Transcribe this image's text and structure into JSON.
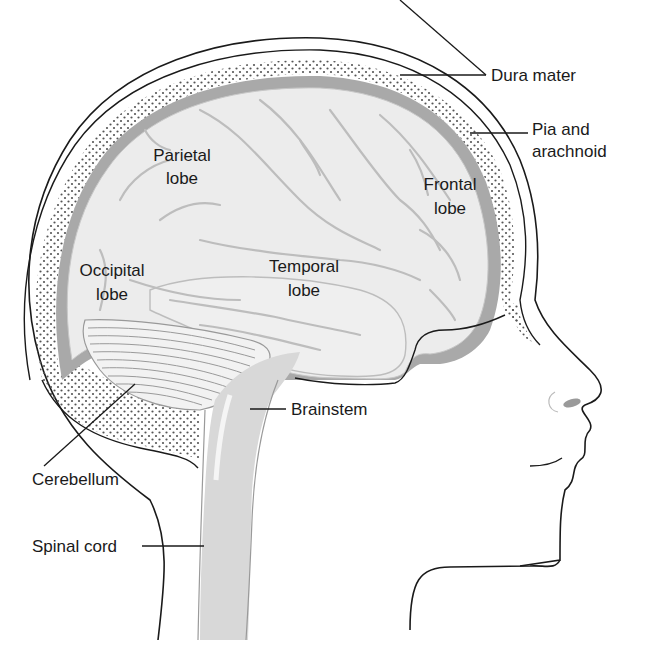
{
  "diagram": {
    "type": "anatomical-illustration",
    "colors": {
      "brain_fill": "#ececec",
      "sulci": "#bdbdbd",
      "meninges_band": "#a9a9a9",
      "outline": "#1a1a1a",
      "dots": "#555555",
      "background": "#ffffff"
    }
  },
  "labels": {
    "dura_mater": "Dura mater",
    "pia_line1": "Pia and",
    "pia_line2": "arachnoid",
    "parietal_line1": "Parietal",
    "parietal_line2": "lobe",
    "frontal_line1": "Frontal",
    "frontal_line2": "lobe",
    "occipital_line1": "Occipital",
    "occipital_line2": "lobe",
    "temporal_line1": "Temporal",
    "temporal_line2": "lobe",
    "brainstem": "Brainstem",
    "cerebellum": "Cerebellum",
    "spinal_cord": "Spinal cord"
  }
}
